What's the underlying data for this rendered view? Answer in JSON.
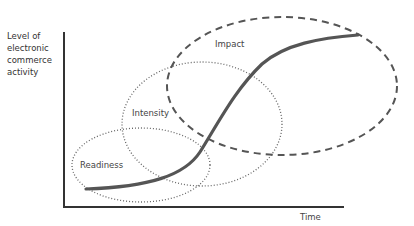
{
  "diagram": {
    "y_axis_label_lines": [
      "Level of",
      "electronic",
      "commerce",
      "activity"
    ],
    "x_axis_label": "Time",
    "phases": [
      {
        "name": "Readiness",
        "style": "dotted"
      },
      {
        "name": "Intensity",
        "style": "dotted"
      },
      {
        "name": "Impact",
        "style": "dashed"
      }
    ],
    "curve": "S-curve (growth over time)",
    "colors": {
      "axis": "#333333",
      "curve": "#555555",
      "ellipse": "#666666"
    }
  }
}
